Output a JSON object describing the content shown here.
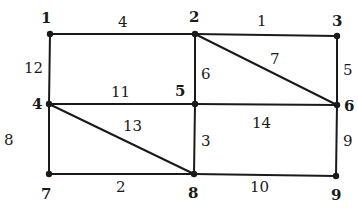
{
  "graph": {
    "nodes": [
      {
        "id": "1",
        "label": "1",
        "x": 50,
        "y": 34,
        "lx": 41,
        "ly": 23
      },
      {
        "id": "2",
        "label": "2",
        "x": 195,
        "y": 34,
        "lx": 189,
        "ly": 22
      },
      {
        "id": "3",
        "label": "3",
        "x": 337,
        "y": 36,
        "lx": 332,
        "ly": 26
      },
      {
        "id": "4",
        "label": "4",
        "x": 49,
        "y": 104,
        "lx": 32,
        "ly": 109
      },
      {
        "id": "5",
        "label": "5",
        "x": 195,
        "y": 104,
        "lx": 175,
        "ly": 96
      },
      {
        "id": "6",
        "label": "6",
        "x": 337,
        "y": 105,
        "lx": 344,
        "ly": 111
      },
      {
        "id": "7",
        "label": "7",
        "x": 49,
        "y": 174,
        "lx": 41,
        "ly": 199
      },
      {
        "id": "8",
        "label": "8",
        "x": 194,
        "y": 174,
        "lx": 188,
        "ly": 198
      },
      {
        "id": "9",
        "label": "9",
        "x": 336,
        "y": 176,
        "lx": 331,
        "ly": 200
      }
    ],
    "edges": [
      {
        "from": "1",
        "to": "2",
        "weight": "4",
        "lx": 118,
        "ly": 27
      },
      {
        "from": "2",
        "to": "3",
        "weight": "1",
        "lx": 257,
        "ly": 26
      },
      {
        "from": "1",
        "to": "4",
        "weight": "12",
        "lx": 24,
        "ly": 73
      },
      {
        "from": "2",
        "to": "5",
        "weight": "6",
        "lx": 201,
        "ly": 79
      },
      {
        "from": "2",
        "to": "6",
        "weight": "7",
        "lx": 270,
        "ly": 64
      },
      {
        "from": "3",
        "to": "6",
        "weight": "5",
        "lx": 343,
        "ly": 75
      },
      {
        "from": "4",
        "to": "5",
        "weight": "11",
        "lx": 111,
        "ly": 97
      },
      {
        "from": "5",
        "to": "6",
        "weight": "14",
        "lx": 252,
        "ly": 128
      },
      {
        "from": "4",
        "to": "8",
        "weight": "13",
        "lx": 123,
        "ly": 131
      },
      {
        "from": "4",
        "to": "7",
        "weight": "8",
        "lx": 4,
        "ly": 145
      },
      {
        "from": "5",
        "to": "8",
        "weight": "3",
        "lx": 201,
        "ly": 146
      },
      {
        "from": "6",
        "to": "9",
        "weight": "9",
        "lx": 343,
        "ly": 146
      },
      {
        "from": "7",
        "to": "8",
        "weight": "2",
        "lx": 116,
        "ly": 192
      },
      {
        "from": "8",
        "to": "9",
        "weight": "10",
        "lx": 250,
        "ly": 192
      }
    ]
  }
}
